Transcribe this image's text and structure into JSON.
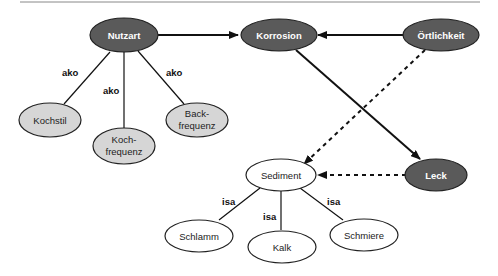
{
  "diagram": {
    "nodes": {
      "nutzart": {
        "label": "Nutzart",
        "style": "dark"
      },
      "korrosion": {
        "label": "Korrosion",
        "style": "dark"
      },
      "oertlichkeit": {
        "label": "Örtlichkeit",
        "style": "dark"
      },
      "leck": {
        "label": "Leck",
        "style": "dark"
      },
      "kochstil": {
        "label": "Kochstil",
        "style": "gray"
      },
      "kochfrequenz": {
        "label_line1": "Koch-",
        "label_line2": "frequenz",
        "style": "gray"
      },
      "backfrequenz": {
        "label_line1": "Back-",
        "label_line2": "frequenz",
        "style": "gray"
      },
      "sediment": {
        "label": "Sediment",
        "style": "white"
      },
      "schlamm": {
        "label": "Schlamm",
        "style": "white"
      },
      "kalk": {
        "label": "Kalk",
        "style": "white"
      },
      "schmiere": {
        "label": "Schmiere",
        "style": "white"
      }
    },
    "edge_labels": {
      "ako_kochstil": "ako",
      "ako_kochfrequenz": "ako",
      "ako_backfrequenz": "ako",
      "isa_schlamm": "isa",
      "isa_kalk": "isa",
      "isa_schmiere": "isa"
    },
    "edges": [
      {
        "from": "Nutzart",
        "to": "Korrosion",
        "type": "solid-arrow"
      },
      {
        "from": "Örtlichkeit",
        "to": "Korrosion",
        "type": "solid-arrow"
      },
      {
        "from": "Korrosion",
        "to": "Leck",
        "type": "solid-arrow"
      },
      {
        "from": "Örtlichkeit",
        "to": "Sediment",
        "type": "dashed-arrow"
      },
      {
        "from": "Leck",
        "to": "Sediment",
        "type": "dashed-arrow"
      },
      {
        "from": "Nutzart",
        "to": "Kochstil",
        "type": "ako"
      },
      {
        "from": "Nutzart",
        "to": "Koch-frequenz",
        "type": "ako"
      },
      {
        "from": "Nutzart",
        "to": "Back-frequenz",
        "type": "ako"
      },
      {
        "from": "Sediment",
        "to": "Schlamm",
        "type": "isa"
      },
      {
        "from": "Sediment",
        "to": "Kalk",
        "type": "isa"
      },
      {
        "from": "Sediment",
        "to": "Schmiere",
        "type": "isa"
      }
    ],
    "colors": {
      "dark_node": "#5a5a5a",
      "gray_node": "#d6d6d6",
      "white_node": "#ffffff",
      "line": "#111111"
    }
  }
}
